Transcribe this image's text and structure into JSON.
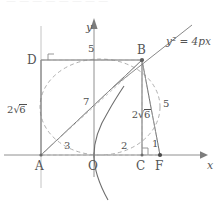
{
  "figure": {
    "kind": "geometry-diagram",
    "curve_equation": "y² = 4px",
    "axis": {
      "x_label": "x",
      "y_label": "y",
      "origin_label": "O"
    },
    "points": [
      {
        "id": "A",
        "label": "A",
        "x": 41,
        "y": 155,
        "marker": "tick",
        "on_axis": true
      },
      {
        "id": "O",
        "label": "O",
        "x": 94,
        "y": 155,
        "marker": "tick",
        "on_axis": true
      },
      {
        "id": "C",
        "label": "C",
        "x": 142,
        "y": 155,
        "marker": "dot",
        "on_axis": true
      },
      {
        "id": "F",
        "label": "F",
        "x": 160,
        "y": 155,
        "marker": "dot",
        "on_axis": true
      },
      {
        "id": "D",
        "label": "D",
        "x": 41,
        "y": 60,
        "marker": "none",
        "on_axis": false
      },
      {
        "id": "B",
        "label": "B",
        "x": 142,
        "y": 60,
        "marker": "dot",
        "on_axis": false
      }
    ],
    "segment_labels": [
      {
        "id": "DB",
        "text": "5",
        "style": "plain",
        "x": 88,
        "y": 45
      },
      {
        "id": "AD",
        "text": "2√6",
        "style": "radical",
        "lead": "2",
        "radicand": "6",
        "x": 8,
        "y": 99
      },
      {
        "id": "AB",
        "text": "7",
        "style": "plain",
        "x": 83,
        "y": 98
      },
      {
        "id": "BC",
        "text": "2√6",
        "style": "radical",
        "lead": "2",
        "radicand": "6",
        "x": 108,
        "y": 103
      },
      {
        "id": "BF",
        "text": "5",
        "style": "plain",
        "x": 163,
        "y": 100
      },
      {
        "id": "AO",
        "text": "3",
        "style": "plain",
        "x": 65,
        "y": 142
      },
      {
        "id": "OC",
        "text": "2",
        "style": "plain",
        "x": 122,
        "y": 142
      },
      {
        "id": "CF",
        "text": "1",
        "style": "plain",
        "x": 152,
        "y": 140
      }
    ],
    "right_angle_markers": [
      {
        "id": "right-angle-D",
        "at": "D",
        "x": 41,
        "y": 60
      },
      {
        "id": "right-angle-C",
        "at": "C",
        "x": 142,
        "y": 155
      }
    ],
    "solid_segments": [
      {
        "id": "DB",
        "from": "D",
        "to": "B"
      },
      {
        "id": "AD",
        "from": "A",
        "to": "D"
      },
      {
        "id": "AB",
        "from": "A",
        "to": "B"
      },
      {
        "id": "BC",
        "from": "B",
        "to": "C"
      },
      {
        "id": "BF",
        "from": "B",
        "to": "F"
      }
    ],
    "dashed_segments": [
      {
        "id": "dashed-DB",
        "from": "D",
        "to": "B"
      },
      {
        "id": "dashed-AB",
        "from": "A",
        "to": "B"
      },
      {
        "id": "dashed-AF",
        "from": "A",
        "to": "F"
      },
      {
        "id": "dashed-BF",
        "from": "B",
        "to": "F"
      },
      {
        "id": "dashed-BC",
        "from": "B",
        "to": "C"
      }
    ],
    "dashed_conic": {
      "id": "dashed-ellipse",
      "cx": 100,
      "cy": 107,
      "rx": 60,
      "ry": 48
    },
    "colors": {
      "stroke": "#6e6e6e",
      "dashed_stroke": "#9a9a9a",
      "axis": "#8a8a8a",
      "text": "#4f4f4f",
      "background": "#ffffff"
    }
  },
  "top_cutoff_text": "—  —  —   —  —   —    —  —"
}
